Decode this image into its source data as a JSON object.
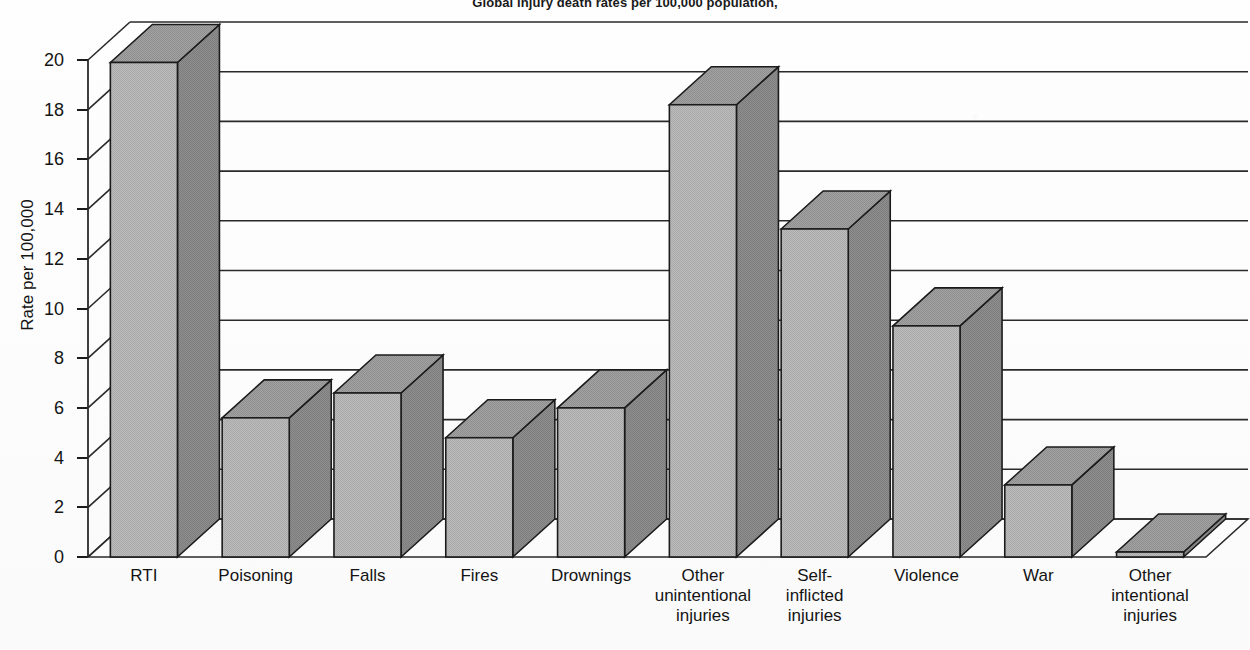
{
  "chart_data": {
    "type": "bar",
    "title": "Global injury death rates per 100,000 population,",
    "xlabel": "",
    "ylabel": "Rate per 100,000",
    "ylim": [
      0,
      20
    ],
    "yticks": [
      0,
      2,
      4,
      6,
      8,
      10,
      12,
      14,
      16,
      18,
      20
    ],
    "ytick_labels": [
      "0",
      "2",
      "4",
      "6",
      "8",
      "10",
      "12",
      "14",
      "16",
      "18",
      "20"
    ],
    "grid": true,
    "legend": "none",
    "style": "3d-column",
    "categories": [
      "RTI",
      "Poisoning",
      "Falls",
      "Fires",
      "Drownings",
      "Other\nunintentional\ninjuries",
      "Self-\ninflicted\ninjuries",
      "Violence",
      "War",
      "Other\nintentional\ninjuries"
    ],
    "values": [
      19.9,
      5.6,
      6.6,
      4.8,
      6.0,
      18.2,
      13.2,
      9.3,
      2.9,
      0.2
    ],
    "colors": {
      "bar_front": "#b5b5b5",
      "bar_side": "#8a8a8a",
      "bar_top": "#9b9b9b",
      "outline": "#1b1b1b",
      "grid": "#2a2a2a",
      "background": "#fdfdfd",
      "text": "#141414"
    }
  }
}
